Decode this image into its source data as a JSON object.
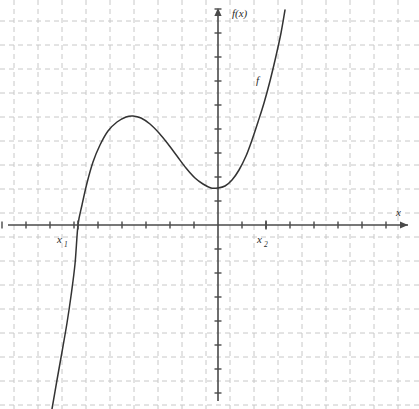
{
  "figure": {
    "name": "cubic-function-graph",
    "width": 419,
    "height": 409,
    "background_color": "#ffffff"
  },
  "labels": {
    "y_axis": "f(x)",
    "x_axis": "x",
    "curve": "f",
    "root_1_base": "x",
    "root_1_sub": "1",
    "root_2_base": "x",
    "root_2_sub": "2"
  },
  "colors": {
    "grid": "#c8c8c8",
    "axis": "#4a4a4a",
    "curve": "#333333",
    "text": "#2b2b2b"
  },
  "chart_data": {
    "type": "line",
    "title": "",
    "xlabel": "x",
    "ylabel": "f(x)",
    "grid": true,
    "legend": false,
    "axis_arrows": true,
    "grid_spacing_px": 24,
    "origin_px": {
      "x": 218,
      "y": 225
    },
    "xlim_px": [
      0,
      419
    ],
    "ylim_px": [
      409,
      0
    ],
    "series": [
      {
        "name": "f",
        "label": "f",
        "label_pos_px": {
          "x": 258,
          "y": 80
        },
        "description": "cubic polynomial with local maximum, local minimum and two marked x-axis intercepts",
        "points_px": [
          [
            52,
            409
          ],
          [
            57,
            380
          ],
          [
            62,
            352
          ],
          [
            67,
            323
          ],
          [
            71,
            296
          ],
          [
            75,
            264
          ],
          [
            78,
            225
          ],
          [
            82,
            205
          ],
          [
            87,
            183
          ],
          [
            93,
            162
          ],
          [
            100,
            145
          ],
          [
            108,
            131
          ],
          [
            117,
            122
          ],
          [
            126,
            117
          ],
          [
            133,
            116
          ],
          [
            141,
            118
          ],
          [
            150,
            124
          ],
          [
            159,
            133
          ],
          [
            168,
            144
          ],
          [
            177,
            156
          ],
          [
            186,
            168
          ],
          [
            195,
            178
          ],
          [
            203,
            184
          ],
          [
            211,
            188
          ],
          [
            218,
            188
          ],
          [
            225,
            186
          ],
          [
            232,
            180
          ],
          [
            239,
            170
          ],
          [
            246,
            156
          ],
          [
            252,
            140
          ],
          [
            258,
            122
          ],
          [
            264,
            103
          ],
          [
            270,
            81
          ],
          [
            276,
            56
          ],
          [
            281,
            33
          ],
          [
            285,
            10
          ]
        ]
      }
    ],
    "annotations": [
      {
        "name": "root-1",
        "label": "x1",
        "display": "x₁",
        "axis": "x",
        "intercept_px": 78,
        "tick_px": {
          "x": 78,
          "y": 225
        },
        "text_px": {
          "x": 58,
          "y": 241
        }
      },
      {
        "name": "root-2",
        "label": "x2",
        "display": "x₂",
        "axis": "x",
        "intercept_px": 266,
        "tick_px": {
          "x": 266,
          "y": 225
        },
        "text_px": {
          "x": 258,
          "y": 241
        }
      }
    ],
    "x_ticks_px": [
      2,
      26,
      50,
      74,
      98,
      122,
      146,
      170,
      194,
      218,
      242,
      266,
      290,
      314,
      338,
      362,
      386
    ],
    "y_ticks_px": [
      9,
      33,
      57,
      81,
      105,
      129,
      153,
      177,
      201,
      225,
      249,
      273,
      297,
      321,
      345,
      369,
      393
    ],
    "grid_x_px": [
      14,
      38,
      62,
      86,
      110,
      134,
      158,
      182,
      206,
      230,
      254,
      278,
      302,
      326,
      350,
      374,
      398
    ],
    "grid_y_px": [
      21,
      45,
      69,
      93,
      117,
      141,
      165,
      189,
      213,
      237,
      261,
      285,
      309,
      333,
      357,
      381,
      405
    ]
  }
}
